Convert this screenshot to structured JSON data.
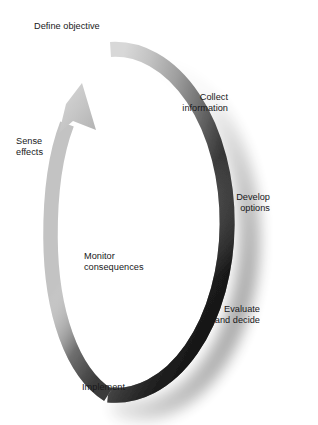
{
  "diagram": {
    "type": "cyclic-loop",
    "direction": "counterclockwise",
    "shape": "ellipse-arrow-ring",
    "arrowhead": {
      "name": "arrowhead",
      "position": "top-left",
      "points_toward": "Define objective"
    },
    "colors": {
      "background": "#ffffff",
      "text": "#18181a",
      "ring_light": "#c9c9c9",
      "ring_mid": "#8a8a8a",
      "ring_dark": "#1b1b1b",
      "shadow": "#9a9a9a"
    },
    "labels": [
      {
        "id": "define-objective",
        "text": "Define objective",
        "align": "left",
        "position": "top-left"
      },
      {
        "id": "collect-information",
        "text": "Collect\ninformation",
        "align": "right",
        "position": "upper-right-inside"
      },
      {
        "id": "develop-options",
        "text": "Develop\noptions",
        "align": "right",
        "position": "mid-right-inside"
      },
      {
        "id": "evaluate-decide",
        "text": "Evaluate\nand decide",
        "align": "right",
        "position": "lower-right-inside"
      },
      {
        "id": "monitor-consequences",
        "text": "Monitor\nconsequences",
        "align": "left",
        "position": "lower-left-inside"
      },
      {
        "id": "sense-effects",
        "text": "Sense\neffects",
        "align": "left",
        "position": "mid-left-outside"
      },
      {
        "id": "implement",
        "text": "Implement",
        "align": "left",
        "position": "bottom-left-outside"
      }
    ]
  }
}
